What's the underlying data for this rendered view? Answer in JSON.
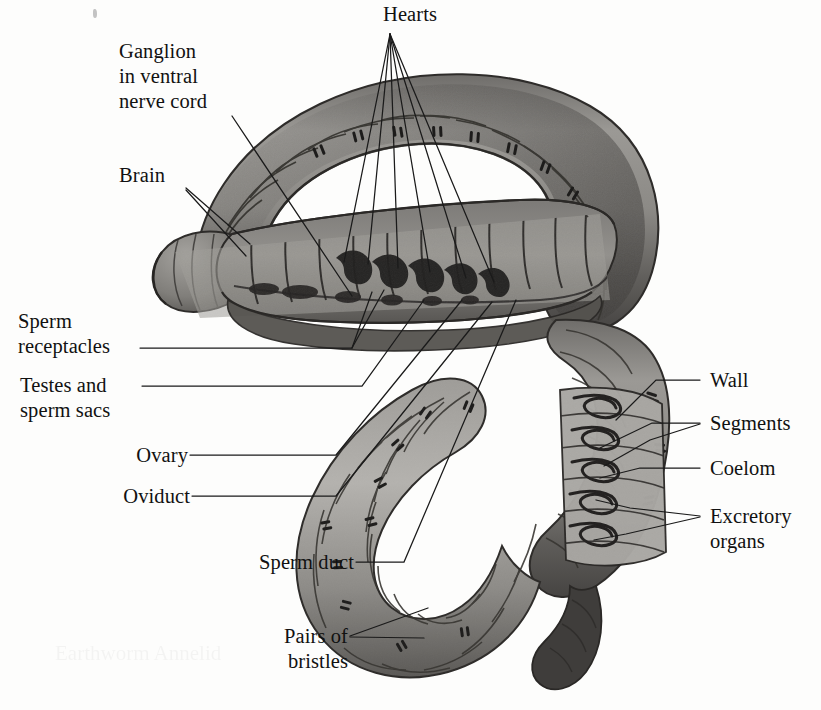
{
  "figure": {
    "background_color": "#fdfdfc",
    "ink_color": "#111111",
    "body_light": "#b2b0ac",
    "body_mid": "#8a8884",
    "body_dark": "#5d5b58",
    "body_darkest": "#3b3a38"
  },
  "labels": {
    "hearts": "Hearts",
    "ganglion": "Ganglion\nin ventral\nnerve cord",
    "brain": "Brain",
    "sperm_receptacles": "Sperm\nreceptacles",
    "testes": "Testes and\nsperm sacs",
    "ovary": "Ovary",
    "oviduct": "Oviduct",
    "sperm_duct": "Sperm duct",
    "pairs_of_bristles": "Pairs of\nbristles",
    "wall": "Wall",
    "segments": "Segments",
    "coelom": "Coelom",
    "excretory_organs": "Excretory\norgans"
  },
  "ghost_text": "Earthworm\nAnnelid"
}
